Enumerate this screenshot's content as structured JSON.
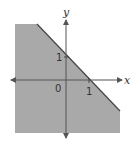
{
  "diagram": {
    "inequality": "x + y ≤ 1",
    "boundary_line": "x + y = 1",
    "shade_color": "#a9a9a9",
    "axis_color": "#444444",
    "labels": {
      "x_axis": "x",
      "y_axis": "y",
      "origin": "0",
      "x_intercept": "1",
      "y_intercept": "1"
    }
  }
}
